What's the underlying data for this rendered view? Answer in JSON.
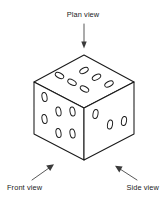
{
  "figure": {
    "background_color": "#ffffff",
    "line_color": "#1a1a1a",
    "face_fill_color": "#ffffff",
    "arrow_color": "#3a3a3a",
    "labels": {
      "plan": "Plan view",
      "front": "Front view",
      "side": "Side view"
    },
    "faces": {
      "top": {
        "name": "Plan view face",
        "pip_count": 6
      },
      "front_left": {
        "name": "Front view face",
        "pip_count": 6
      },
      "right": {
        "name": "Side view face",
        "pip_count": 3
      }
    }
  }
}
